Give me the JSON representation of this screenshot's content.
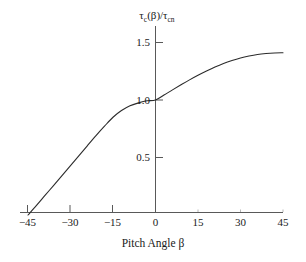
{
  "chart_data": {
    "type": "line",
    "title": "",
    "subtitle": "",
    "xlabel": "Pitch Angle β",
    "ylabel": "τc(β)/τcn",
    "ylabel_parts": {
      "tau1": "τ",
      "sub1": "c",
      "arg": "(β)/",
      "tau2": "τ",
      "sub2": "cn"
    },
    "xlim": [
      -45,
      45
    ],
    "ylim": [
      0,
      1.55
    ],
    "grid": false,
    "legend": false,
    "legend_position": "none",
    "line_color": "#2b2b2b",
    "axis_color": "#595959",
    "background_color": "#ffffff",
    "x_ticks": [
      -45,
      -30,
      -15,
      0,
      15,
      30,
      45
    ],
    "x_tick_labels": [
      "−45",
      "−30",
      "−15",
      "0",
      "15",
      "30",
      "45"
    ],
    "y_ticks": [
      0.5,
      1.0,
      1.5
    ],
    "y_tick_labels": [
      "0.5",
      "1.0",
      "1.5"
    ],
    "series": [
      {
        "name": "τc(β)/τcn",
        "x": [
          -45,
          -42,
          -39,
          -36,
          -33,
          -30,
          -27,
          -24,
          -21,
          -18,
          -15,
          -12,
          -9,
          -6,
          -3,
          0,
          3,
          6,
          9,
          12,
          15,
          18,
          21,
          24,
          27,
          30,
          33,
          36,
          39,
          42,
          45
        ],
        "values": [
          0.0,
          0.083,
          0.17,
          0.256,
          0.343,
          0.43,
          0.517,
          0.604,
          0.69,
          0.772,
          0.85,
          0.908,
          0.95,
          0.975,
          0.993,
          1.0,
          1.043,
          1.088,
          1.132,
          1.175,
          1.215,
          1.252,
          1.287,
          1.318,
          1.344,
          1.366,
          1.383,
          1.396,
          1.404,
          1.409,
          1.411
        ]
      }
    ],
    "annotations": [
      {
        "name": "curve-left-endpoint",
        "x": -45,
        "y": 0.0
      },
      {
        "name": "curve-crosses-unity",
        "x": 0,
        "y": 1.0
      },
      {
        "name": "curve-right-endpoint",
        "x": 45,
        "y": 1.41
      }
    ]
  }
}
